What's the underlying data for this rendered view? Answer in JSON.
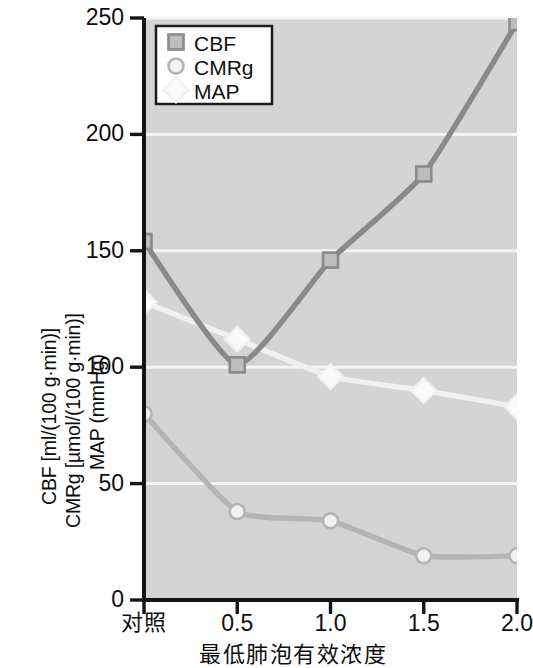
{
  "chart_data": {
    "type": "line",
    "title": "",
    "xlabel": "最低肺泡有效浓度",
    "ylabel_lines": [
      "CBF [ml/(100 g·min)]",
      "CMRg [µmol/(100 g·min)]",
      "MAP (mmHg)"
    ],
    "categories": [
      "对照",
      "0.5",
      "1.0",
      "1.5",
      "2.0"
    ],
    "x_numeric": [
      0,
      0.5,
      1.0,
      1.5,
      2.0
    ],
    "xtick_labels": [
      "对照",
      "0.5",
      "1.0",
      "1.5",
      "2.0"
    ],
    "ytick_labels": [
      "0",
      "50",
      "100",
      "150",
      "200",
      "250"
    ],
    "ytick_values": [
      0,
      50,
      100,
      150,
      200,
      250
    ],
    "ylim": [
      0,
      250
    ],
    "grid": "horizontal-white",
    "legend_position": "top-left-inside",
    "plot_background": "#d4d4d4",
    "series": [
      {
        "name": "CBF",
        "marker": "square",
        "color": "#8a8a8a",
        "marker_fill": "#bdbdbd",
        "values": [
          154,
          101,
          146,
          183,
          248
        ]
      },
      {
        "name": "CMRg",
        "marker": "circle",
        "color": "#b4b4b4",
        "marker_fill": "#f2f2f2",
        "values": [
          80,
          38,
          34,
          19,
          19
        ]
      },
      {
        "name": "MAP",
        "marker": "diamond",
        "color": "#f0f0f0",
        "marker_fill": "#fafafa",
        "values": [
          128,
          112,
          96,
          90,
          83
        ]
      }
    ]
  },
  "legend": {
    "entries": [
      {
        "label": "CBF"
      },
      {
        "label": "CMRg"
      },
      {
        "label": "MAP"
      }
    ]
  },
  "colors": {
    "axis": "#141414",
    "plot_bg": "#d4d4d4",
    "gridline": "#f5f5f5",
    "cbf": "#8a8a8a",
    "cmrg": "#b4b4b4",
    "map": "#f0f0f0",
    "text": "#0d0d0d"
  }
}
